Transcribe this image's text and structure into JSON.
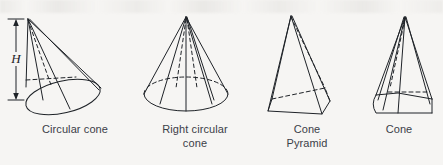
{
  "figure": {
    "background_color": "#f6f5f3",
    "ink_color": "#1f2328",
    "caption_color": "#3b4048",
    "dimension_label": "H",
    "shapes": [
      {
        "id": "circular-cone",
        "caption": "Circular cone",
        "kind": "oblique-circular-cone",
        "has_dimension_marker": true,
        "hidden_edges": "dashed"
      },
      {
        "id": "right-circular-cone",
        "caption": "Right circular\ncone",
        "kind": "right-circular-cone",
        "has_dimension_marker": false,
        "hidden_edges": "dashed"
      },
      {
        "id": "cone-pyramid",
        "caption": "Cone\nPyramid",
        "kind": "pyramid",
        "has_dimension_marker": false,
        "hidden_edges": "dashed"
      },
      {
        "id": "cone",
        "caption": "Cone",
        "kind": "general-cone",
        "has_dimension_marker": false,
        "hidden_edges": "dashed"
      }
    ]
  }
}
